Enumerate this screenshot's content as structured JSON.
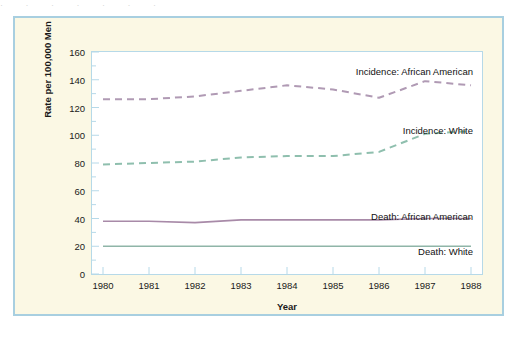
{
  "figure": {
    "top_artifact_text": "· ·    ·     ·          ·   ·     ·",
    "frame_color": "#a8cfe0",
    "background_color": "#fbf8e4",
    "plot_background_color": "#ffffff",
    "axis_color": "#b6d9e8"
  },
  "chart_data": {
    "type": "line",
    "title": "",
    "xlabel": "Year",
    "ylabel": "Rate per 100,000 Men",
    "x": [
      1980,
      1981,
      1982,
      1983,
      1984,
      1985,
      1986,
      1987,
      1988
    ],
    "xtick_labels": [
      "1980",
      "1981",
      "1982",
      "1983",
      "1984",
      "1985",
      "1986",
      "1987",
      "1988"
    ],
    "xlim": [
      1980,
      1988
    ],
    "ylim": [
      0,
      160
    ],
    "ytick_labels": [
      "0",
      "20",
      "40",
      "60",
      "80",
      "100",
      "120",
      "140",
      "160"
    ],
    "yticks": [
      0,
      20,
      40,
      60,
      80,
      100,
      120,
      140,
      160
    ],
    "y_minor_tick_interval": 10,
    "grid": false,
    "legend_position": "inline-right",
    "series": [
      {
        "name": "Incidence: African American",
        "style": "dashed",
        "color": "#b09ab4",
        "values": [
          126,
          126,
          128,
          132,
          136,
          133,
          127,
          139,
          136
        ]
      },
      {
        "name": "Incidence: White",
        "style": "dashed",
        "color": "#8fbfae",
        "values": [
          79,
          80,
          81,
          84,
          85,
          85,
          88,
          101,
          103
        ]
      },
      {
        "name": "Death: African American",
        "style": "solid",
        "color": "#a88aa8",
        "values": [
          38,
          38,
          37,
          39,
          39,
          39,
          39,
          40,
          40
        ]
      },
      {
        "name": "Death: White",
        "style": "solid",
        "color": "#8fb5a8",
        "values": [
          20,
          20,
          20,
          20,
          20,
          20,
          20,
          20,
          20
        ]
      }
    ],
    "annotations": [
      {
        "text": "Incidence: African American",
        "x_px": 458,
        "y_px": 48
      },
      {
        "text": "Incidence: White",
        "x_px": 458,
        "y_px": 107
      },
      {
        "text": "Death: African American",
        "x_px": 458,
        "y_px": 193
      },
      {
        "text": "Death: White",
        "x_px": 458,
        "y_px": 228
      }
    ]
  }
}
